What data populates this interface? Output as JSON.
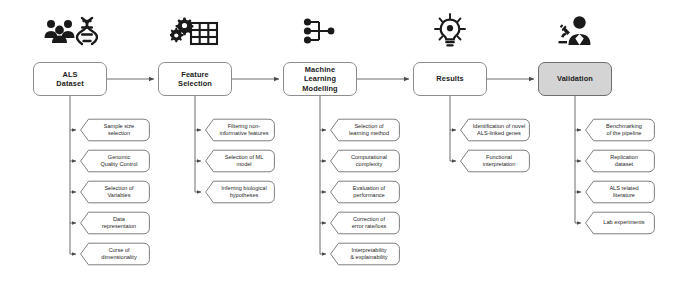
{
  "diagram": {
    "stage_box_fill": "#ffffff",
    "stage_box_highlight_fill": "#d4d4d4",
    "line_color": "#5b5b5b",
    "text_color": "#1f1f1f"
  },
  "stages": [
    {
      "id": "als-dataset",
      "label": "ALS\nDataset",
      "label_lines": [
        "ALS",
        "Dataset"
      ],
      "icon": "people-dna-icon",
      "highlighted": false,
      "x": 33,
      "items": [
        {
          "label_lines": [
            "Sample size",
            "selection"
          ]
        },
        {
          "label_lines": [
            "Genomic",
            "Quality Control"
          ]
        },
        {
          "label_lines": [
            "Selection of",
            "Variables"
          ]
        },
        {
          "label_lines": [
            "Data",
            "representaion"
          ]
        },
        {
          "label_lines": [
            "Curse of",
            "dimensionality"
          ]
        }
      ]
    },
    {
      "id": "feature-selection",
      "label": "Feature\nSelection",
      "label_lines": [
        "Feature",
        "Selection"
      ],
      "icon": "gears-table-icon",
      "highlighted": false,
      "x": 158,
      "items": [
        {
          "label_lines": [
            "Filtering non-",
            "informative features"
          ]
        },
        {
          "label_lines": [
            "Selection of ML",
            "model"
          ]
        },
        {
          "label_lines": [
            "Inferring biological",
            "hypotheses"
          ]
        }
      ]
    },
    {
      "id": "machine-learning-modelling",
      "label": "Machine\nLearning\nModelling",
      "label_lines": [
        "Machine",
        "Learning",
        "Modelling"
      ],
      "icon": "node-tree-icon",
      "highlighted": false,
      "x": 283,
      "items": [
        {
          "label_lines": [
            "Selection of",
            "learning method"
          ]
        },
        {
          "label_lines": [
            "Computational",
            "complexity"
          ]
        },
        {
          "label_lines": [
            "Evaluation of",
            "performance"
          ]
        },
        {
          "label_lines": [
            "Correction of",
            "error rate/loss"
          ]
        },
        {
          "label_lines": [
            "Interpretability",
            "& explainability"
          ]
        }
      ]
    },
    {
      "id": "results",
      "label": "Results",
      "label_lines": [
        "Results"
      ],
      "icon": "lightbulb-icon",
      "highlighted": false,
      "x": 413,
      "items": [
        {
          "label_lines": [
            "Identification of novel",
            "ALS-linked genes"
          ]
        },
        {
          "label_lines": [
            "Functional",
            "interpretation"
          ]
        }
      ]
    },
    {
      "id": "validation",
      "label": "Validation",
      "label_lines": [
        "Validation"
      ],
      "icon": "scientist-microscope-icon",
      "highlighted": true,
      "x": 538,
      "items": [
        {
          "label_lines": [
            "Benchmarking",
            "of the pipeline"
          ]
        },
        {
          "label_lines": [
            "Replication",
            "dataset"
          ]
        },
        {
          "label_lines": [
            "ALS related",
            "literature"
          ]
        },
        {
          "label_lines": [
            "Lab experiments"
          ]
        }
      ]
    }
  ],
  "layout": {
    "stage_y": 62,
    "icon_y": 8,
    "first_item_y": 118,
    "item_spacing": 31,
    "item_offset_x": 46
  }
}
